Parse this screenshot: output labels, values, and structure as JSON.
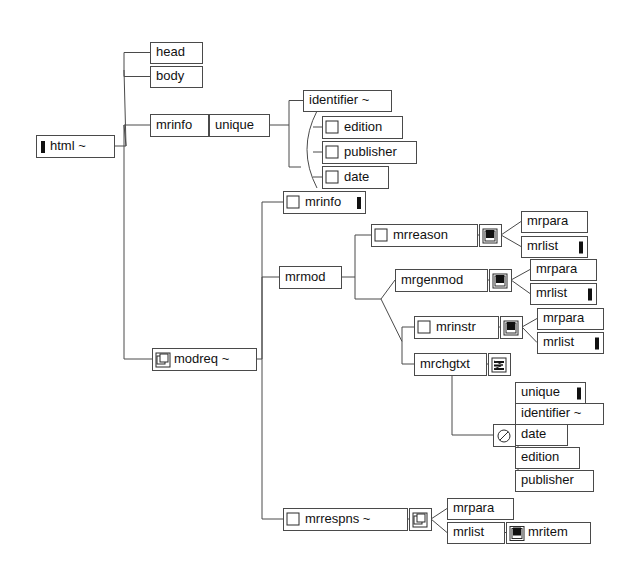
{
  "diagram": {
    "type": "tree",
    "canvas": {
      "width": 643,
      "height": 570
    },
    "colors": {
      "background": "#ffffff",
      "box_stroke": "#4a4a4a",
      "link_stroke": "#4a4a4a",
      "text": "#111111",
      "icon_fill": "#111111"
    },
    "icon_legend": {
      "bar": "filled-vertical-bar-icon",
      "checkbox": "empty-square-icon",
      "square-in-square": "filled-square-in-square-icon",
      "copy": "copy-pages-icon",
      "lines": "text-lines-icon",
      "prohibited": "circle-slash-icon"
    },
    "nodes": [
      {
        "id": "html",
        "label": "html ~",
        "x": 36,
        "y": 135,
        "w": 78,
        "h": 22,
        "icon_left": "bar",
        "icon_right": "none"
      },
      {
        "id": "head",
        "label": "head",
        "x": 150,
        "y": 42,
        "w": 52,
        "h": 21,
        "icon_left": "none",
        "icon_right": "none"
      },
      {
        "id": "body",
        "label": "body",
        "x": 150,
        "y": 66,
        "w": 52,
        "h": 21,
        "icon_left": "none",
        "icon_right": "none"
      },
      {
        "id": "mrinfo1",
        "label": "mrinfo",
        "x": 150,
        "y": 114,
        "w": 58,
        "h": 22,
        "icon_left": "none",
        "icon_right": "none"
      },
      {
        "id": "unique1",
        "label": "unique",
        "x": 209,
        "y": 114,
        "w": 60,
        "h": 22,
        "icon_left": "none",
        "icon_right": "none"
      },
      {
        "id": "identifier1",
        "label": "identifier ~",
        "x": 303,
        "y": 90,
        "w": 88,
        "h": 21,
        "icon_left": "none",
        "icon_right": "none"
      },
      {
        "id": "edition1",
        "label": "edition",
        "x": 322,
        "y": 116,
        "w": 80,
        "h": 22,
        "icon_left": "checkbox",
        "icon_right": "none"
      },
      {
        "id": "publisher1",
        "label": "publisher",
        "x": 322,
        "y": 141,
        "w": 94,
        "h": 22,
        "icon_left": "checkbox",
        "icon_right": "none"
      },
      {
        "id": "date1",
        "label": "date",
        "x": 322,
        "y": 166,
        "w": 66,
        "h": 22,
        "icon_left": "checkbox",
        "icon_right": "none"
      },
      {
        "id": "mrinfo2",
        "label": "mrinfo",
        "x": 283,
        "y": 191,
        "w": 82,
        "h": 22,
        "icon_left": "checkbox",
        "icon_right": "bar"
      },
      {
        "id": "mrmod",
        "label": "mrmod",
        "x": 279,
        "y": 266,
        "w": 62,
        "h": 22,
        "icon_left": "none",
        "icon_right": "none"
      },
      {
        "id": "mrreason",
        "label": "mrreason",
        "x": 371,
        "y": 224,
        "w": 106,
        "h": 22,
        "icon_left": "checkbox",
        "icon_right": "none"
      },
      {
        "id": "mrreason-ic",
        "label": "",
        "x": 479,
        "y": 224,
        "w": 22,
        "h": 22,
        "icon_left": "square-in-square",
        "icon_right": "none"
      },
      {
        "id": "mrpara1",
        "label": "mrpara",
        "x": 521,
        "y": 211,
        "w": 66,
        "h": 21,
        "icon_left": "none",
        "icon_right": "none"
      },
      {
        "id": "mrlist1",
        "label": "mrlist",
        "x": 521,
        "y": 236,
        "w": 66,
        "h": 21,
        "icon_left": "none",
        "icon_right": "bar"
      },
      {
        "id": "mrgenmod",
        "label": "mrgenmod",
        "x": 395,
        "y": 269,
        "w": 92,
        "h": 22,
        "icon_left": "none",
        "icon_right": "none"
      },
      {
        "id": "mrgenmod-ic",
        "label": "",
        "x": 489,
        "y": 269,
        "w": 22,
        "h": 22,
        "icon_left": "square-in-square",
        "icon_right": "none"
      },
      {
        "id": "mrpara2",
        "label": "mrpara",
        "x": 530,
        "y": 259,
        "w": 66,
        "h": 21,
        "icon_left": "none",
        "icon_right": "none"
      },
      {
        "id": "mrlist2",
        "label": "mrlist",
        "x": 530,
        "y": 283,
        "w": 66,
        "h": 21,
        "icon_left": "none",
        "icon_right": "bar"
      },
      {
        "id": "mrinstr",
        "label": "mrinstr",
        "x": 414,
        "y": 316,
        "w": 84,
        "h": 22,
        "icon_left": "checkbox",
        "icon_right": "none"
      },
      {
        "id": "mrinstr-ic",
        "label": "",
        "x": 500,
        "y": 316,
        "w": 22,
        "h": 22,
        "icon_left": "square-in-square",
        "icon_right": "none"
      },
      {
        "id": "mrpara3",
        "label": "mrpara",
        "x": 537,
        "y": 308,
        "w": 66,
        "h": 21,
        "icon_left": "none",
        "icon_right": "none"
      },
      {
        "id": "mrlist3",
        "label": "mrlist",
        "x": 537,
        "y": 332,
        "w": 66,
        "h": 21,
        "icon_left": "none",
        "icon_right": "bar"
      },
      {
        "id": "mrchgtxt",
        "label": "mrchgtxt",
        "x": 414,
        "y": 353,
        "w": 72,
        "h": 22,
        "icon_left": "none",
        "icon_right": "none"
      },
      {
        "id": "mrchgtxt-ic",
        "label": "",
        "x": 488,
        "y": 353,
        "w": 22,
        "h": 22,
        "icon_left": "lines",
        "icon_right": "none"
      },
      {
        "id": "slash-ic",
        "label": "",
        "x": 493,
        "y": 424,
        "w": 22,
        "h": 22,
        "icon_left": "prohibited",
        "icon_right": "none"
      },
      {
        "id": "unique2",
        "label": "unique",
        "x": 515,
        "y": 382,
        "w": 70,
        "h": 21,
        "icon_left": "none",
        "icon_right": "bar"
      },
      {
        "id": "identifier2",
        "label": "identifier ~",
        "x": 515,
        "y": 403,
        "w": 88,
        "h": 21,
        "icon_left": "none",
        "icon_right": "none"
      },
      {
        "id": "date2",
        "label": "date",
        "x": 515,
        "y": 424,
        "w": 52,
        "h": 21,
        "icon_left": "none",
        "icon_right": "none"
      },
      {
        "id": "edition2",
        "label": "edition",
        "x": 515,
        "y": 447,
        "w": 64,
        "h": 21,
        "icon_left": "none",
        "icon_right": "none"
      },
      {
        "id": "publisher2",
        "label": "publisher",
        "x": 515,
        "y": 470,
        "w": 78,
        "h": 21,
        "icon_left": "none",
        "icon_right": "none"
      },
      {
        "id": "modreq",
        "label": "modreq ~",
        "x": 152,
        "y": 348,
        "w": 104,
        "h": 22,
        "icon_left": "copy",
        "icon_right": "none"
      },
      {
        "id": "mrrespns",
        "label": "mrrespns ~",
        "x": 283,
        "y": 508,
        "w": 124,
        "h": 22,
        "icon_left": "checkbox",
        "icon_right": "none"
      },
      {
        "id": "mrrespns-ic",
        "label": "",
        "x": 409,
        "y": 508,
        "w": 22,
        "h": 22,
        "icon_left": "copy",
        "icon_right": "none"
      },
      {
        "id": "mrpara4",
        "label": "mrpara",
        "x": 447,
        "y": 498,
        "w": 66,
        "h": 21,
        "icon_left": "none",
        "icon_right": "none"
      },
      {
        "id": "mrlist4",
        "label": "mrlist",
        "x": 447,
        "y": 522,
        "w": 57,
        "h": 21,
        "icon_left": "none",
        "icon_right": "none"
      },
      {
        "id": "mritem",
        "label": "mritem",
        "x": 506,
        "y": 522,
        "w": 84,
        "h": 21,
        "icon_left": "square-in-square",
        "icon_right": "none"
      }
    ],
    "edges": [
      {
        "from": "html",
        "to": "head"
      },
      {
        "from": "html",
        "to": "body"
      },
      {
        "from": "html",
        "to": "mrinfo1"
      },
      {
        "from": "html",
        "to": "modreq"
      },
      {
        "from": "mrinfo1",
        "to": "unique1"
      },
      {
        "from": "unique1",
        "to": "identifier1"
      },
      {
        "from": "unique1",
        "to": "edition1"
      },
      {
        "from": "unique1",
        "to": "publisher1"
      },
      {
        "from": "unique1",
        "to": "date1"
      },
      {
        "from": "modreq",
        "to": "mrinfo2"
      },
      {
        "from": "modreq",
        "to": "mrmod"
      },
      {
        "from": "modreq",
        "to": "mrrespns"
      },
      {
        "from": "mrmod",
        "to": "mrreason"
      },
      {
        "from": "mrmod",
        "to": "mrgenmod"
      },
      {
        "from": "mrmod",
        "to": "mrinstr"
      },
      {
        "from": "mrmod",
        "to": "mrchgtxt"
      },
      {
        "from": "mrreason-ic",
        "to": "mrpara1"
      },
      {
        "from": "mrreason-ic",
        "to": "mrlist1"
      },
      {
        "from": "mrgenmod-ic",
        "to": "mrpara2"
      },
      {
        "from": "mrgenmod-ic",
        "to": "mrlist2"
      },
      {
        "from": "mrinstr-ic",
        "to": "mrpara3"
      },
      {
        "from": "mrinstr-ic",
        "to": "mrlist3"
      },
      {
        "from": "mrchgtxt",
        "to": "slash-ic"
      },
      {
        "from": "slash-ic",
        "to": "unique2"
      },
      {
        "from": "slash-ic",
        "to": "identifier2"
      },
      {
        "from": "slash-ic",
        "to": "date2"
      },
      {
        "from": "slash-ic",
        "to": "edition2"
      },
      {
        "from": "slash-ic",
        "to": "publisher2"
      },
      {
        "from": "mrrespns-ic",
        "to": "mrpara4"
      },
      {
        "from": "mrrespns-ic",
        "to": "mrlist4"
      },
      {
        "from": "mrlist4",
        "to": "mritem"
      }
    ]
  }
}
